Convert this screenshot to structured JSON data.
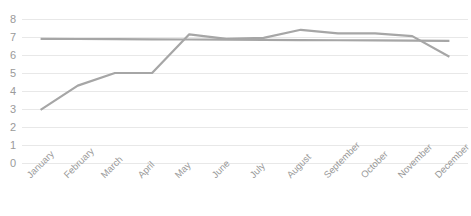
{
  "chart_data": {
    "type": "line",
    "title": "",
    "subtitle": "",
    "xlabel": "",
    "ylabel": "",
    "categories": [
      "January",
      "February",
      "March",
      "April",
      "May",
      "June",
      "July",
      "August",
      "September",
      "October",
      "November",
      "December"
    ],
    "series": [
      {
        "name": "Series 1",
        "color": "#a6a6a6",
        "values": [
          2.95,
          4.3,
          5.0,
          5.0,
          7.15,
          6.9,
          6.95,
          7.4,
          7.2,
          7.2,
          7.05,
          5.9
        ]
      },
      {
        "name": "Series 2",
        "color": "#a6a6a6",
        "values": [
          6.9,
          6.89,
          6.88,
          6.87,
          6.86,
          6.85,
          6.84,
          6.83,
          6.82,
          6.81,
          6.8,
          6.79
        ]
      }
    ],
    "ylim": [
      0,
      8
    ],
    "ytick_labels": [
      "8",
      "7",
      "6",
      "5",
      "4",
      "3",
      "2",
      "1",
      "0"
    ],
    "ytick_values": [
      8,
      7,
      6,
      5,
      4,
      3,
      2,
      1,
      0
    ],
    "grid": true,
    "grid_axis": "y",
    "grid_color": "#e8e8e8",
    "legend": false,
    "legend_position": "none",
    "plot_background": "#ffffff",
    "tick_label_color": "#9a9a9a",
    "xtick_rotation_degrees": -45
  }
}
